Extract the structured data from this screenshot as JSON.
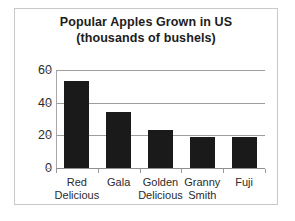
{
  "chart_data": {
    "type": "bar",
    "title": "Popular Apples Grown in US",
    "subtitle": "(thousands of bushels)",
    "xlabel": "",
    "ylabel": "",
    "categories": [
      "Red Delicious",
      "Gala",
      "Golden Delicious",
      "Granny Smith",
      "Fuji"
    ],
    "category_lines": [
      [
        "Red",
        "Delicious"
      ],
      [
        "Gala",
        ""
      ],
      [
        "Golden",
        "Delicious"
      ],
      [
        "Granny",
        "Smith"
      ],
      [
        "Fuji",
        ""
      ]
    ],
    "values": [
      53,
      34,
      23,
      19,
      19
    ],
    "ylim": [
      0,
      60
    ],
    "yticks": [
      0,
      20,
      40,
      60
    ],
    "ytick_labels": [
      "0",
      "20",
      "40",
      "60"
    ],
    "grid": true,
    "legend": "none",
    "bar_color": "#1a1a1a",
    "gridline_color": "#9e9e9e",
    "frame_color": "#c9c9c9",
    "text_color": "#1c1c1c",
    "background_color": "#ffffff"
  }
}
